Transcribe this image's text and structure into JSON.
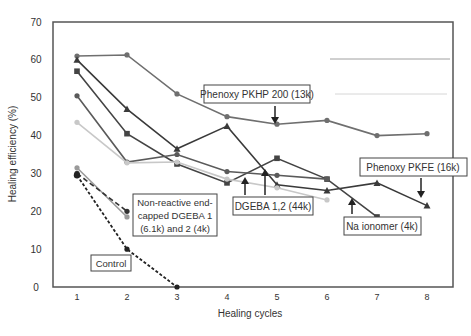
{
  "chart_data": {
    "type": "line",
    "title": "",
    "xlabel": "Healing cycles",
    "ylabel": "Healing efficiency (%)",
    "xlim": [
      0.55,
      8.5
    ],
    "ylim": [
      0,
      70
    ],
    "x_ticks": [
      1,
      2,
      3,
      4,
      5,
      6,
      7,
      8
    ],
    "y_ticks": [
      0,
      10,
      20,
      30,
      40,
      50,
      60,
      70
    ],
    "grid": false,
    "series": [
      {
        "name": "Phenoxy PKHP 200 (13k)",
        "color": "#6f6f6f",
        "marker": "circle",
        "dash": "solid",
        "x": [
          1,
          2,
          3,
          4,
          5,
          6,
          7,
          8
        ],
        "y": [
          61,
          61.3,
          51,
          45,
          43,
          44,
          40,
          40.5
        ]
      },
      {
        "name": "Phenoxy PKFE (16k)",
        "color": "#3a3a3a",
        "marker": "triangle",
        "dash": "solid",
        "x": [
          1,
          2,
          3,
          4,
          5,
          6,
          7,
          8
        ],
        "y": [
          60,
          47,
          36.5,
          42.5,
          27,
          25.5,
          27.5,
          21.5
        ]
      },
      {
        "name": "Na ionomer (4k)",
        "color": "#444444",
        "marker": "square",
        "dash": "solid",
        "x": [
          1,
          2,
          3,
          4,
          5,
          6,
          7
        ],
        "y": [
          57,
          40.5,
          32.5,
          27.5,
          34,
          28.5,
          18.5
        ]
      },
      {
        "name": "DGEBA 1",
        "color": "#5a5a5a",
        "marker": "circle",
        "dash": "solid",
        "x": [
          1,
          2,
          3,
          4,
          5,
          6
        ],
        "y": [
          50.5,
          33,
          35,
          30.5,
          29.5,
          28.5
        ]
      },
      {
        "name": "DGEBA 2",
        "color": "#c8c8c8",
        "marker": "circle",
        "dash": "solid",
        "x": [
          1,
          2,
          3,
          4,
          5,
          6
        ],
        "y": [
          43.5,
          32.8,
          33,
          28.5,
          26.2,
          23
        ]
      },
      {
        "name": "Non-reactive end-capped DGEBA 1 (6.1k)",
        "color": "#9a9a9a",
        "marker": "circle",
        "dash": "solid",
        "x": [
          1,
          2
        ],
        "y": [
          31.5,
          18.5
        ]
      },
      {
        "name": "Non-reactive end-capped DGEBA 2 (4k)",
        "color": "#333333",
        "marker": "circle",
        "dash": "dashed",
        "x": [
          1,
          2
        ],
        "y": [
          30,
          20
        ]
      },
      {
        "name": "Control",
        "color": "#222222",
        "marker": "circle",
        "dash": "dotted",
        "x": [
          1,
          2,
          3
        ],
        "y": [
          29.5,
          10,
          0
        ]
      }
    ],
    "annotations": [
      {
        "text": "Phenoxy PKHP 200 (13k)",
        "arrow": "down",
        "points_to": [
          5,
          43
        ]
      },
      {
        "text": "Phenoxy PKFE (16k)",
        "arrow": "down",
        "points_to": [
          8,
          21.5
        ]
      },
      {
        "text": "DGEBA 1,2 (44k)",
        "arrow": "up",
        "points_to": [
          4.5,
          26
        ]
      },
      {
        "text": "Na ionomer (4k)",
        "arrow": "up",
        "points_to": [
          6.5,
          21
        ]
      },
      {
        "text": [
          "Non-reactive end-",
          "capped DGEBA 1",
          "(6.1k) and 2 (4k)"
        ],
        "arrow": "none"
      },
      {
        "text": "Control",
        "arrow": "none"
      }
    ]
  }
}
